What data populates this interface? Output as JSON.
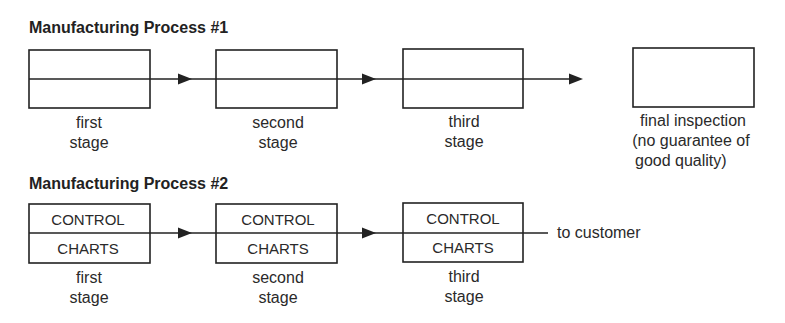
{
  "process1": {
    "title": "Manufacturing Process #1",
    "stages": [
      {
        "line1": "first",
        "line2": "stage"
      },
      {
        "line1": "second",
        "line2": "stage"
      },
      {
        "line1": "third",
        "line2": "stage"
      }
    ],
    "final": {
      "line1": "final inspection",
      "line2": "(no guarantee of",
      "line3": "good quality)"
    }
  },
  "process2": {
    "title": "Manufacturing Process #2",
    "stages": [
      {
        "top": "CONTROL",
        "bottom": "CHARTS",
        "line1": "first",
        "line2": "stage"
      },
      {
        "top": "CONTROL",
        "bottom": "CHARTS",
        "line1": "second",
        "line2": "stage"
      },
      {
        "top": "CONTROL",
        "bottom": "CHARTS",
        "line1": "third",
        "line2": "stage"
      }
    ],
    "output_label": "to customer"
  }
}
